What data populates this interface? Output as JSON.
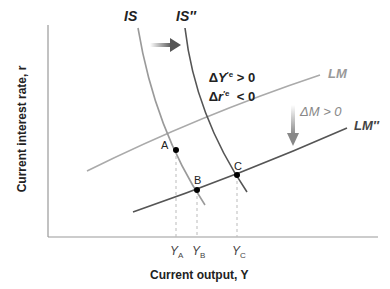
{
  "diagram": {
    "axes": {
      "y_label": "Current interest rate, r",
      "x_label": "Current output, Y"
    },
    "curves": {
      "is": {
        "label": "IS",
        "color": "#9a9a9a"
      },
      "is2": {
        "label": "IS″",
        "color": "#555555"
      },
      "lm": {
        "label": "LM",
        "color": "#aaaaaa"
      },
      "lm2": {
        "label": "LM″",
        "color": "#555555"
      }
    },
    "annotations": {
      "dy": "ΔY′e > 0",
      "dy_main": "Δ",
      "dy_var": "Y",
      "dy_sup": "′e",
      "dy_rel": " > 0",
      "dr_main": "Δ",
      "dr_var": "r",
      "dr_sup": "′e",
      "dr_rel": "  < 0",
      "dm": "ΔM > 0"
    },
    "points": [
      {
        "label": "A",
        "x_label": "Y",
        "x_sub": "A"
      },
      {
        "label": "B",
        "x_label": "Y",
        "x_sub": "B"
      },
      {
        "label": "C",
        "x_label": "Y",
        "x_sub": "C"
      }
    ]
  }
}
